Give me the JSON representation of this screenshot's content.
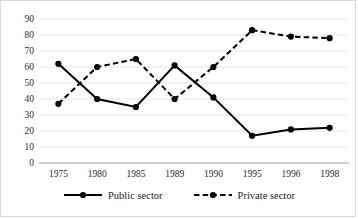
{
  "chart_data": {
    "type": "line",
    "title": "",
    "xlabel": "",
    "ylabel": "",
    "ylim": [
      0,
      90
    ],
    "ytick_step": 10,
    "yticks": [
      90,
      80,
      70,
      60,
      50,
      40,
      30,
      20,
      10,
      0
    ],
    "grid": true,
    "legend_position": "bottom",
    "categories": [
      "1975",
      "1980",
      "1985",
      "1989",
      "1990",
      "1995",
      "1996",
      "1998"
    ],
    "series": [
      {
        "name": "Public sector",
        "style": "solid",
        "marker": "circle",
        "color": "#000000",
        "values": [
          62,
          40,
          35,
          61,
          41,
          17,
          21,
          22
        ]
      },
      {
        "name": "Private sector",
        "style": "dashed",
        "marker": "circle",
        "color": "#000000",
        "values": [
          37,
          60,
          65,
          40,
          60,
          83,
          79,
          78
        ]
      }
    ]
  },
  "legend": {
    "items": [
      {
        "label": "Public sector",
        "style": "solid"
      },
      {
        "label": "Private sector",
        "style": "dashed"
      }
    ]
  }
}
